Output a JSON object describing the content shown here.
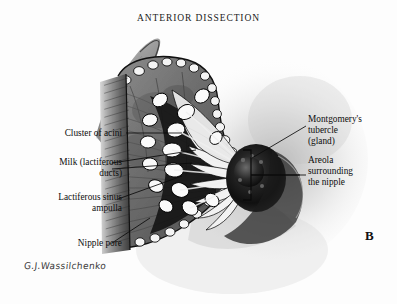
{
  "figure": {
    "title": "ANTERIOR DISSECTION",
    "panel_label": "B",
    "signature": "G.J.Wassilchenko",
    "background_color": "#fdfdfd",
    "ink_color": "#0d0d0d"
  },
  "labels": {
    "left": [
      {
        "id": "cluster-of-acini",
        "text": "Cluster of acini"
      },
      {
        "id": "milk-ducts",
        "text": "Milk (lactiferous\nducts)"
      },
      {
        "id": "lactiferous-sinus",
        "text": "Lactiferous sinus\nampulla"
      },
      {
        "id": "nipple-pore",
        "text": "Nipple pore"
      }
    ],
    "right": [
      {
        "id": "montgomery-tubercle",
        "text": "Montgomery's\ntubercle\n(gland)"
      },
      {
        "id": "areola",
        "text": "Areola\nsurrounding\nthe nipple"
      }
    ]
  },
  "illustration": {
    "type": "halftone-anatomical-drawing",
    "elements": [
      "sectioned breast flap with glandular lobules",
      "radiating lactiferous ducts converging at nipple",
      "dark pigmented areola and nipple",
      "bracket marking areola extent",
      "soft grey breast contour in background"
    ]
  }
}
